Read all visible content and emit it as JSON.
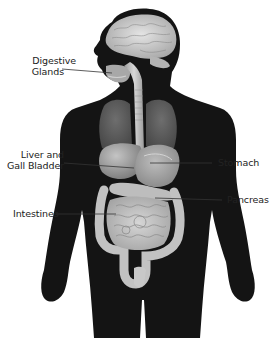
{
  "diagram": {
    "type": "anatomical-illustration",
    "colors": {
      "background": "#ffffff",
      "body_silhouette": "#141414",
      "organs_light": "#c8c8c8",
      "organs_mid": "#9a9a9a",
      "lungs": "#5a5a5a",
      "leader_lines": "#333333",
      "label_text": "#222222"
    },
    "labels": [
      {
        "id": "digestive-glands",
        "lines": [
          "Digestive",
          "Glands"
        ],
        "side": "left"
      },
      {
        "id": "liver-gall-bladder",
        "lines": [
          "Liver and",
          "Gall Bladder"
        ],
        "side": "left"
      },
      {
        "id": "intestines",
        "lines": [
          "Intestines"
        ],
        "side": "left"
      },
      {
        "id": "stomach",
        "lines": [
          "Stomach"
        ],
        "side": "right"
      },
      {
        "id": "pancreas",
        "lines": [
          "Pancreas"
        ],
        "side": "right"
      }
    ]
  }
}
